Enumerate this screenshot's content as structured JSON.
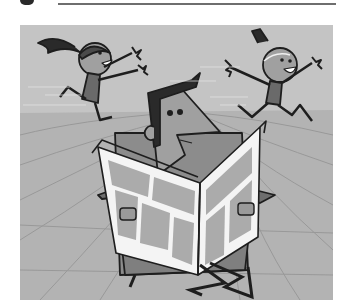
{
  "page": {
    "background": "#ffffff",
    "rule_color": "#6e6e6e"
  },
  "illustration": {
    "description": "Cartoon of a man reading a newspaper in an armchair while two children run and jump around him",
    "palette": {
      "wall": "#c4c4c4",
      "floor": "#b0b0b0",
      "floor_lines": "#8f8f8f",
      "chair": "#8a8a8a",
      "skin": "#9a9a9a",
      "outline": "#1e1e1e",
      "paper": "#f4f4f4",
      "paper_panel": "#a9a9a9",
      "hair": "#2a2a2a"
    },
    "figures": [
      "girl-left",
      "girl-right",
      "man-reading-newspaper",
      "armchair"
    ]
  }
}
